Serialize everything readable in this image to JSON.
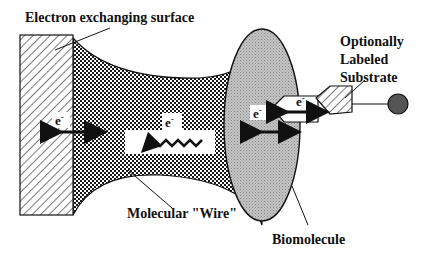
{
  "labels": {
    "surface": "Electron exchanging surface",
    "substrate_line1": "Optionally",
    "substrate_line2": "Labeled",
    "substrate_line3": "Substrate",
    "wire": "Molecular \"Wire\"",
    "biomolecule": "Biomolecule"
  },
  "electrons": {
    "surface_exchange": "e",
    "wire_transfer": "e",
    "biomolecule_exchange": "e",
    "substrate_exchange": "e",
    "superscript": "-"
  },
  "colors": {
    "ink": "#111111",
    "biomolecule_fill": "#b8b8b8",
    "label_dot": "#555555"
  }
}
